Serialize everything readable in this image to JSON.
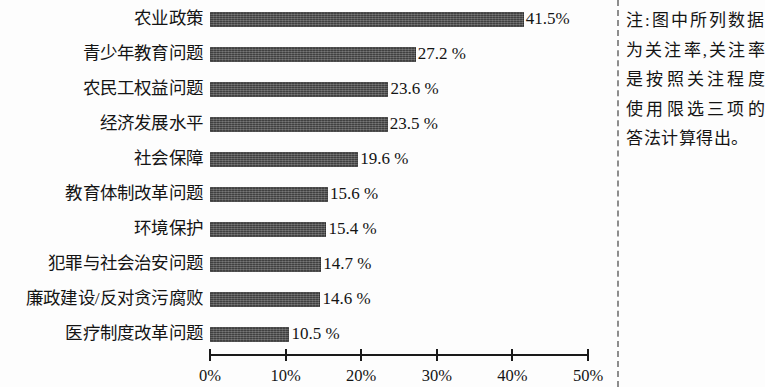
{
  "chart_data": {
    "type": "bar",
    "orientation": "horizontal",
    "title": "",
    "xlabel": "",
    "ylabel": "",
    "xlim": [
      0,
      50
    ],
    "grid": false,
    "legend": null,
    "categories": [
      "农业政策",
      "青少年教育问题",
      "农民工权益问题",
      "经济发展水平",
      "社会保障",
      "教育体制改革问题",
      "环境保护",
      "犯罪与社会治安问题",
      "廉政建设/反对贪污腐败",
      "医疗制度改革问题"
    ],
    "values": [
      41.5,
      27.2,
      23.6,
      23.5,
      19.6,
      15.6,
      15.4,
      14.7,
      14.6,
      10.5
    ],
    "value_labels": [
      "41.5%",
      "27.2 %",
      "23.6 %",
      "23.5 %",
      "19.6 %",
      "15.6 %",
      "15.4 %",
      "14.7 %",
      "14.6 %",
      "10.5 %"
    ],
    "x_ticks": [
      0,
      10,
      20,
      30,
      40,
      50
    ],
    "x_tick_labels": [
      "0%",
      "10%",
      "20%",
      "30%",
      "40%",
      "50%"
    ],
    "bar_color": "#4b4b4b"
  },
  "note": {
    "text": "注:图中所列数据为关注率,关注率是按照关注程度使用限选三项的答法计算得出。"
  }
}
